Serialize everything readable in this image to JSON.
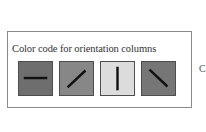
{
  "legend": {
    "title": "Color code for orientation columns",
    "swatches": [
      {
        "orientation": "horizontal",
        "angle_deg": 0,
        "fill": "#6e6e6e"
      },
      {
        "orientation": "oblique-45",
        "angle_deg": 45,
        "fill": "#878787"
      },
      {
        "orientation": "vertical",
        "angle_deg": 90,
        "fill": "#dcdcdc"
      },
      {
        "orientation": "oblique-135",
        "angle_deg": 135,
        "fill": "#767676"
      }
    ],
    "bar_color": "#111111"
  },
  "edge_text": "C"
}
